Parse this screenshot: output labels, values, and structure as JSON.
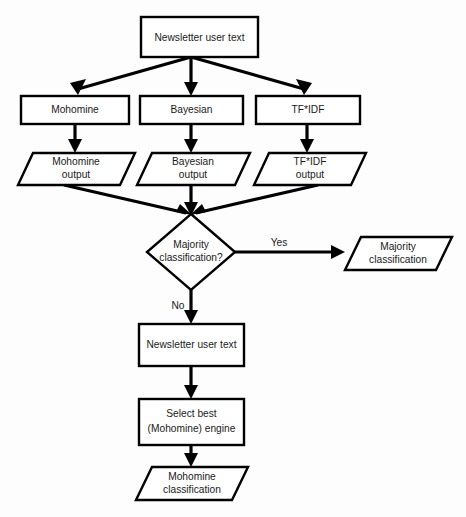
{
  "figure": {
    "type": "flowchart",
    "background_color": "#fdfdfd",
    "line_color": "#000000",
    "text_color": "#1a1a1a"
  },
  "nodes": {
    "input_top": {
      "shape": "process",
      "label": "Newsletter user text"
    },
    "engine_mohomine": {
      "shape": "process",
      "label": "Mohomine"
    },
    "engine_bayesian": {
      "shape": "process",
      "label": "Bayesian"
    },
    "engine_tfidf": {
      "shape": "process",
      "label": "TF*IDF"
    },
    "output_mohomine": {
      "shape": "data",
      "label_line1": "Mohomine",
      "label_line2": "output"
    },
    "output_bayesian": {
      "shape": "data",
      "label_line1": "Bayesian",
      "label_line2": "output"
    },
    "output_tfidf": {
      "shape": "data",
      "label_line1": "TF*IDF",
      "label_line2": "output"
    },
    "decision_majority": {
      "shape": "decision",
      "label_line1": "Majority",
      "label_line2": "classification?"
    },
    "result_majority": {
      "shape": "data",
      "label_line1": "Majority",
      "label_line2": "classification"
    },
    "input_second": {
      "shape": "process",
      "label": "Newsletter user text"
    },
    "select_engine": {
      "shape": "process",
      "label_line1": "Select best",
      "label_line2": "(Mohomine) engine"
    },
    "result_mohomine": {
      "shape": "data",
      "label_line1": "Mohomine",
      "label_line2": "classification"
    }
  },
  "edges": {
    "yes_branch": {
      "label": "Yes"
    },
    "no_branch": {
      "label": "No"
    }
  }
}
